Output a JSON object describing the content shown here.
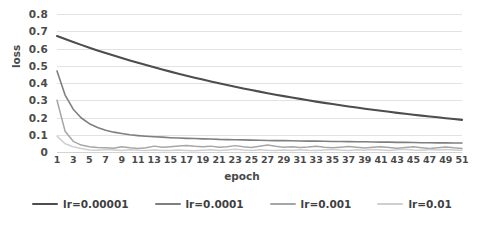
{
  "chart_data": {
    "type": "line",
    "title": "",
    "xlabel": "epoch",
    "ylabel": "loss",
    "xlim": [
      1,
      51
    ],
    "ylim": [
      0,
      0.8
    ],
    "grid": true,
    "legend_position": "bottom",
    "y_ticks": [
      "0.8",
      "0.7",
      "0.6",
      "0.5",
      "0.4",
      "0.3",
      "0.2",
      "0.1",
      "0"
    ],
    "y_tick_values": [
      0.8,
      0.7,
      0.6,
      0.5,
      0.4,
      0.3,
      0.2,
      0.1,
      0
    ],
    "x_ticks": [
      "1",
      "3",
      "5",
      "7",
      "9",
      "11",
      "13",
      "15",
      "17",
      "19",
      "21",
      "23",
      "25",
      "27",
      "29",
      "31",
      "33",
      "35",
      "37",
      "39",
      "41",
      "43",
      "45",
      "47",
      "49",
      "51"
    ],
    "x": [
      1,
      2,
      3,
      4,
      5,
      6,
      7,
      8,
      9,
      10,
      11,
      12,
      13,
      14,
      15,
      16,
      17,
      18,
      19,
      20,
      21,
      22,
      23,
      24,
      25,
      26,
      27,
      28,
      29,
      30,
      31,
      32,
      33,
      34,
      35,
      36,
      37,
      38,
      39,
      40,
      41,
      42,
      43,
      44,
      45,
      46,
      47,
      48,
      49,
      50,
      51
    ],
    "series": [
      {
        "name": "lr=0.00001",
        "color": "#4d4d4d",
        "width": 2.1,
        "values": [
          0.672,
          0.655,
          0.638,
          0.621,
          0.605,
          0.589,
          0.574,
          0.559,
          0.545,
          0.531,
          0.517,
          0.504,
          0.491,
          0.478,
          0.466,
          0.454,
          0.442,
          0.431,
          0.42,
          0.409,
          0.398,
          0.388,
          0.378,
          0.368,
          0.359,
          0.35,
          0.341,
          0.332,
          0.324,
          0.316,
          0.308,
          0.3,
          0.292,
          0.285,
          0.278,
          0.271,
          0.264,
          0.258,
          0.251,
          0.245,
          0.239,
          0.233,
          0.227,
          0.222,
          0.216,
          0.211,
          0.206,
          0.201,
          0.196,
          0.191,
          0.186
        ]
      },
      {
        "name": "lr=0.0001",
        "color": "#7f7f7f",
        "width": 1.6,
        "values": [
          0.47,
          0.33,
          0.248,
          0.197,
          0.164,
          0.142,
          0.126,
          0.115,
          0.107,
          0.1,
          0.095,
          0.091,
          0.088,
          0.086,
          0.083,
          0.081,
          0.079,
          0.078,
          0.076,
          0.075,
          0.073,
          0.072,
          0.071,
          0.07,
          0.069,
          0.068,
          0.067,
          0.066,
          0.066,
          0.065,
          0.064,
          0.063,
          0.063,
          0.062,
          0.061,
          0.061,
          0.06,
          0.059,
          0.059,
          0.058,
          0.057,
          0.057,
          0.056,
          0.056,
          0.055,
          0.054,
          0.054,
          0.053,
          0.053,
          0.052,
          0.052
        ]
      },
      {
        "name": "lr=0.001",
        "color": "#a6a6a6",
        "width": 1.5,
        "values": [
          0.3,
          0.12,
          0.062,
          0.04,
          0.03,
          0.026,
          0.024,
          0.022,
          0.03,
          0.024,
          0.021,
          0.025,
          0.034,
          0.028,
          0.031,
          0.035,
          0.038,
          0.033,
          0.03,
          0.034,
          0.027,
          0.031,
          0.037,
          0.03,
          0.026,
          0.033,
          0.04,
          0.033,
          0.028,
          0.031,
          0.026,
          0.029,
          0.033,
          0.027,
          0.024,
          0.028,
          0.032,
          0.027,
          0.023,
          0.027,
          0.031,
          0.026,
          0.022,
          0.026,
          0.03,
          0.025,
          0.021,
          0.025,
          0.029,
          0.024,
          0.021
        ]
      },
      {
        "name": "lr=0.01",
        "color": "#cfcfcf",
        "width": 1.5,
        "values": [
          0.092,
          0.048,
          0.03,
          0.02,
          0.012,
          0.01,
          0.014,
          0.011,
          0.009,
          0.013,
          0.01,
          0.008,
          0.012,
          0.009,
          0.008,
          0.011,
          0.009,
          0.007,
          0.01,
          0.013,
          0.009,
          0.012,
          0.016,
          0.011,
          0.009,
          0.013,
          0.01,
          0.008,
          0.012,
          0.009,
          0.013,
          0.01,
          0.008,
          0.012,
          0.015,
          0.011,
          0.009,
          0.013,
          0.01,
          0.014,
          0.011,
          0.009,
          0.013,
          0.016,
          0.012,
          0.01,
          0.014,
          0.011,
          0.015,
          0.012,
          0.01
        ]
      }
    ]
  }
}
